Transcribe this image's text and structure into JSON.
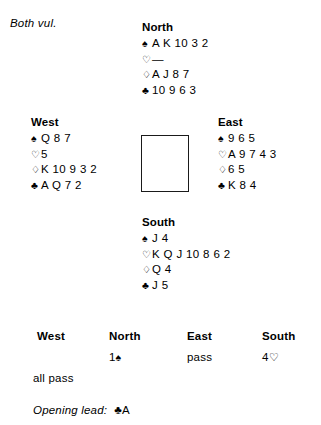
{
  "vulnerability": "Both vul.",
  "suit_symbols": {
    "spade": "♠",
    "heart": "♡",
    "diamond": "♢",
    "club": "♣",
    "void": "—"
  },
  "hands": {
    "north": {
      "label": "North",
      "spades": "A K 10 3 2",
      "hearts": "—",
      "diamonds": "A J 8 7",
      "clubs": "10 9 6 3"
    },
    "west": {
      "label": "West",
      "spades": "Q 8 7",
      "hearts": "5",
      "diamonds": "K 10 9 3 2",
      "clubs": "A Q 7 2"
    },
    "east": {
      "label": "East",
      "spades": "9 6 5",
      "hearts": "A 9 7 4 3",
      "diamonds": "6 5",
      "clubs": "K 8 4"
    },
    "south": {
      "label": "South",
      "spades": "J 4",
      "hearts": "K Q J 10 8 6 2",
      "diamonds": "Q 4",
      "clubs": "J 5"
    }
  },
  "auction": {
    "headers": {
      "west": "West",
      "north": "North",
      "east": "East",
      "south": "South"
    },
    "round1": {
      "west": "",
      "north_level": "1",
      "north_suit": "♠",
      "east": "pass",
      "south_level": "4",
      "south_suit": "♡"
    },
    "all_pass": "all pass"
  },
  "opening_lead": {
    "label": "Opening lead:",
    "suit": "♣",
    "rank": "A"
  }
}
